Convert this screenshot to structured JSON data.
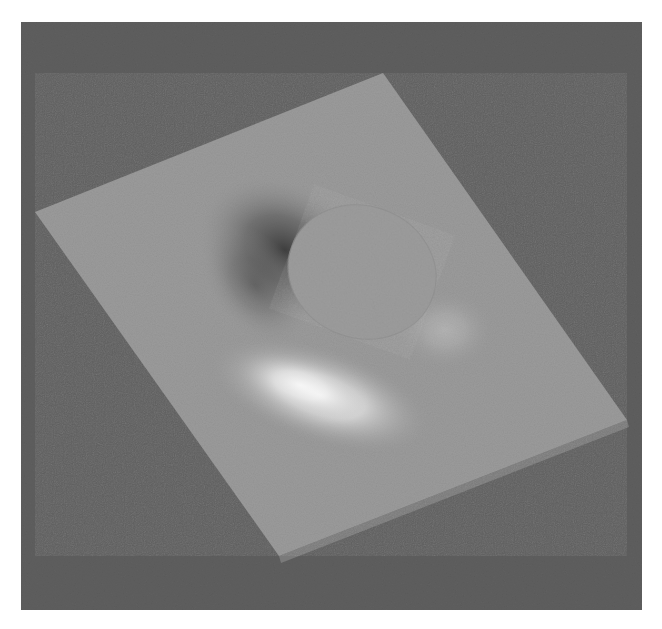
{
  "figure": {
    "colors": {
      "page_background": "#ffffff",
      "frame_background": "#5f5f5f",
      "plate_top": "#9b9b9b",
      "plate_side": "#7c7c7c",
      "disc": "#9d9d9d",
      "shadow": "#3e3e3e",
      "highlight": "#f4f4f4"
    },
    "frame": {
      "x": 21,
      "y": 22,
      "width": 621,
      "height": 588
    },
    "plate_corners": {
      "top": [
        383,
        73
      ],
      "right": [
        627,
        420
      ],
      "bottom": [
        279,
        556
      ],
      "left": [
        35,
        212
      ]
    },
    "disc": {
      "cx": 362,
      "cy": 272,
      "rx": 75,
      "ry": 66,
      "rotation": 20
    }
  }
}
